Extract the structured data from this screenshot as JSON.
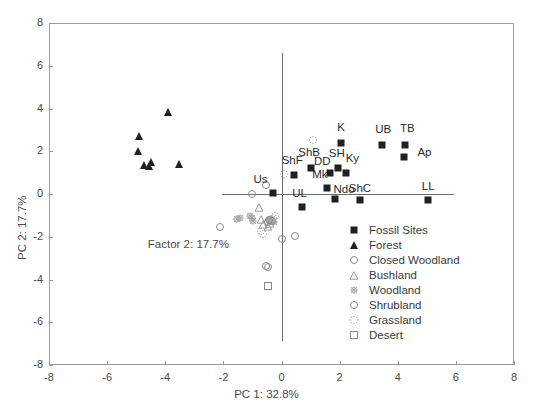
{
  "chart_data": {
    "type": "scatter",
    "title": "",
    "xlabel": "PC 1: 32.8%",
    "ylabel": "PC 2: 17.7%",
    "xlim": [
      -8,
      8
    ],
    "ylim": [
      -8,
      8
    ],
    "xticks": [
      "-8",
      "-6",
      "-4",
      "-2",
      "0",
      "2",
      "4",
      "6",
      "8"
    ],
    "yticks": [
      "8",
      "6",
      "4",
      "2",
      "0",
      "-2",
      "-4",
      "-6",
      "-8"
    ],
    "xtick_values": [
      -8,
      -6,
      -4,
      -2,
      0,
      2,
      4,
      6,
      8
    ],
    "ytick_values": [
      8,
      6,
      4,
      2,
      0,
      -2,
      -4,
      -6,
      -8
    ],
    "grid": false,
    "annotations": [
      {
        "text": "Factor 2: 17.7%",
        "x": -4.6,
        "y": -2.45
      }
    ],
    "legend_position": "lower-right",
    "legend": [
      {
        "label": "Fossil Sites",
        "marker": "square-filled"
      },
      {
        "label": "Forest",
        "marker": "triangle-filled"
      },
      {
        "label": "Closed Woodland",
        "marker": "circle-open"
      },
      {
        "label": "Bushland",
        "marker": "triangle-open"
      },
      {
        "label": "Woodland",
        "marker": "star-hatched"
      },
      {
        "label": "Shrubland",
        "marker": "circle-open"
      },
      {
        "label": "Grassland",
        "marker": "dot-star"
      },
      {
        "label": "Desert",
        "marker": "square-open"
      }
    ],
    "series": [
      {
        "name": "Fossil Sites",
        "marker": "square-filled",
        "points": [
          {
            "label": "Us",
            "x": -0.3,
            "y": 0.05,
            "label_dx": -0.42,
            "label_dy": 0.62
          },
          {
            "label": "ShF",
            "x": 0.42,
            "y": 0.88,
            "label_dx": -0.05,
            "label_dy": 0.68
          },
          {
            "label": "ShB",
            "x": 1.0,
            "y": 1.2,
            "label_dx": -0.05,
            "label_dy": 0.7
          },
          {
            "label": "DD",
            "x": 1.66,
            "y": 0.98,
            "label_dx": -0.26,
            "label_dy": 0.52
          },
          {
            "label": "SH",
            "x": 1.95,
            "y": 1.22,
            "label_dx": -0.05,
            "label_dy": 0.66
          },
          {
            "label": "Ky",
            "x": 2.22,
            "y": 1.0,
            "label_dx": 0.22,
            "label_dy": 0.66
          },
          {
            "label": "Mk",
            "x": 1.58,
            "y": 0.3,
            "label_dx": -0.26,
            "label_dy": 0.6
          },
          {
            "label": "Ndo",
            "x": 1.85,
            "y": -0.22,
            "label_dx": 0.3,
            "label_dy": 0.4
          },
          {
            "label": "ShC",
            "x": 2.7,
            "y": -0.3,
            "label_dx": 0.0,
            "label_dy": 0.52
          },
          {
            "label": "UL",
            "x": 0.72,
            "y": -0.62,
            "label_dx": -0.1,
            "label_dy": 0.64
          },
          {
            "label": "K",
            "x": 2.05,
            "y": 2.4,
            "label_dx": 0.0,
            "label_dy": 0.7
          },
          {
            "label": "UB",
            "x": 3.45,
            "y": 2.3,
            "label_dx": 0.05,
            "label_dy": 0.7
          },
          {
            "label": "TB",
            "x": 4.25,
            "y": 2.3,
            "label_dx": 0.08,
            "label_dy": 0.72
          },
          {
            "label": "Ap",
            "x": 4.2,
            "y": 1.72,
            "label_dx": 0.72,
            "label_dy": 0.22
          },
          {
            "label": "LL",
            "x": 5.05,
            "y": -0.26,
            "label_dx": 0.0,
            "label_dy": 0.58
          }
        ]
      },
      {
        "name": "Forest",
        "marker": "triangle-filled",
        "points": [
          {
            "x": -4.92,
            "y": 2.72
          },
          {
            "x": -4.95,
            "y": 2.02
          },
          {
            "x": -4.72,
            "y": 1.36
          },
          {
            "x": -4.55,
            "y": 1.3
          },
          {
            "x": -4.48,
            "y": 1.48
          },
          {
            "x": -3.9,
            "y": 3.82
          },
          {
            "x": -3.52,
            "y": 1.42
          }
        ]
      },
      {
        "name": "Closed Woodland",
        "marker": "circle-open",
        "points": [
          {
            "x": -2.1,
            "y": -1.55
          },
          {
            "x": -1.0,
            "y": 0.02
          },
          {
            "x": -0.52,
            "y": 0.4
          },
          {
            "x": -0.45,
            "y": -1.3
          },
          {
            "x": -0.4,
            "y": -1.22
          },
          {
            "x": 0.02,
            "y": -2.1
          },
          {
            "x": 0.48,
            "y": -1.95
          }
        ]
      },
      {
        "name": "Bushland",
        "marker": "triangle-open",
        "points": [
          {
            "x": -0.78,
            "y": -0.62
          },
          {
            "x": -0.72,
            "y": -1.18
          },
          {
            "x": -0.62,
            "y": -1.42
          },
          {
            "x": -0.46,
            "y": -1.5
          },
          {
            "x": -0.38,
            "y": -1.36
          }
        ]
      },
      {
        "name": "Woodland",
        "marker": "star-hatched",
        "points": [
          {
            "x": -1.52,
            "y": -1.18
          },
          {
            "x": -1.42,
            "y": -1.12
          },
          {
            "x": -1.08,
            "y": -1.05
          },
          {
            "x": -1.0,
            "y": -1.12
          },
          {
            "x": -0.98,
            "y": -1.25
          },
          {
            "x": -0.4,
            "y": -1.22
          },
          {
            "x": -0.32,
            "y": -1.18
          },
          {
            "x": -0.26,
            "y": -1.32
          }
        ]
      },
      {
        "name": "Shrubland",
        "marker": "circle-open",
        "points": [
          {
            "x": -0.42,
            "y": -1.22
          },
          {
            "x": -0.34,
            "y": -1.28
          },
          {
            "x": -0.55,
            "y": -3.38
          },
          {
            "x": -0.48,
            "y": -3.42
          }
        ]
      },
      {
        "name": "Grassland",
        "marker": "dot-star",
        "points": [
          {
            "x": 1.1,
            "y": 2.52
          },
          {
            "x": 0.1,
            "y": 0.95
          },
          {
            "x": -0.7,
            "y": -1.72
          },
          {
            "x": -0.62,
            "y": -1.88
          },
          {
            "x": -0.3,
            "y": -1.12
          },
          {
            "x": -0.22,
            "y": -1.05
          }
        ]
      },
      {
        "name": "Desert",
        "marker": "square-open",
        "points": [
          {
            "x": -0.46,
            "y": -4.32
          }
        ]
      }
    ]
  }
}
